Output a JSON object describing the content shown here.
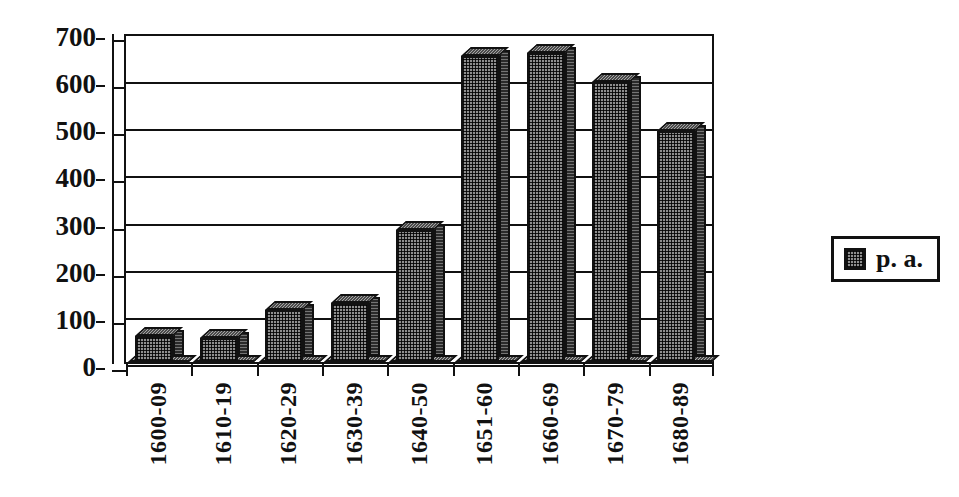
{
  "chart_data": {
    "type": "bar",
    "title": "",
    "subtitle": "",
    "xlabel": "",
    "ylabel": "",
    "categories": [
      "1600-09",
      "1610-19",
      "1620-29",
      "1630-39",
      "1640-50",
      "1651-60",
      "1660-69",
      "1670-79",
      "1680-89"
    ],
    "series": [
      {
        "name": "p. a.",
        "values": [
          55,
          50,
          110,
          125,
          280,
          650,
          655,
          595,
          490
        ]
      }
    ],
    "values": [
      55,
      50,
      110,
      125,
      280,
      650,
      655,
      595,
      490
    ],
    "ylim": [
      0,
      700
    ],
    "yticks": [
      0,
      100,
      200,
      300,
      400,
      500,
      600,
      700
    ],
    "ytick_labels": [
      "0",
      "100",
      "200",
      "300",
      "400",
      "500",
      "600",
      "700"
    ],
    "grid": true,
    "grid_axis": "y",
    "legend": {
      "position": "right",
      "entries": [
        {
          "label": "p. a.",
          "swatch": "hatched-grey"
        }
      ]
    },
    "style": {
      "render": "3d-bars",
      "bar_fill": "#8e8e8e",
      "bar_side": "#2a2a2a",
      "bar_top": "#4a4a4a",
      "outline": "#111111",
      "background": "#ffffff"
    }
  },
  "legend": {
    "label": "p. a.",
    "swatch_name": "hatched-grey-swatch"
  }
}
